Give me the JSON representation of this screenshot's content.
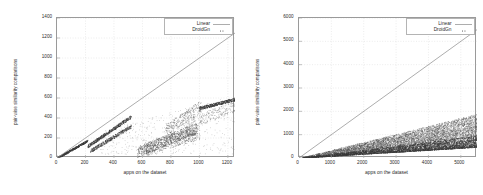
{
  "figure": {
    "panel_count": 2,
    "background": "#ffffff",
    "axis_color": "#9a9a9a",
    "grid_color": "#d8d8d8",
    "text_color": "#2b2b2b",
    "linear_color": "#8a8a8a",
    "point_color": "#3a3a3a"
  },
  "chart_data": [
    {
      "type": "scatter",
      "title": "",
      "xlabel": "apps on the dataset",
      "ylabel": "pair-wise similarity comparisons",
      "xlim": [
        0,
        1250
      ],
      "ylim": [
        0,
        1400
      ],
      "xticks": [
        0,
        200,
        400,
        600,
        800,
        1000,
        1200
      ],
      "yticks": [
        0,
        200,
        400,
        600,
        800,
        1000,
        1200,
        1400
      ],
      "grid": true,
      "legend_position": "top-right",
      "legend": [
        "Linear",
        "DroidGn"
      ],
      "series": [
        {
          "name": "Linear",
          "style": "line",
          "x": [
            0,
            1250
          ],
          "values": [
            0,
            1250
          ],
          "note": "y = x reference line"
        },
        {
          "name": "DroidGn",
          "style": "points",
          "note": "sub-linear scatter: multiple rising diagonal bands with wide dispersion; reaches ~600 comparisons at 1250 apps",
          "x": [
            20,
            60,
            110,
            150,
            180,
            210,
            240,
            280,
            320,
            360,
            400,
            440,
            480,
            520,
            560,
            600,
            650,
            700,
            750,
            800,
            850,
            900,
            950,
            1000,
            1050,
            1100,
            1150,
            1200,
            1250
          ],
          "values": [
            10,
            30,
            55,
            80,
            110,
            140,
            170,
            200,
            230,
            260,
            290,
            320,
            350,
            380,
            410,
            300,
            180,
            140,
            160,
            190,
            230,
            270,
            320,
            420,
            520,
            545,
            560,
            572,
            585
          ]
        }
      ]
    },
    {
      "type": "scatter",
      "title": "",
      "xlabel": "apps on the dataset",
      "ylabel": "pair-wise similarity comparisons",
      "xlim": [
        0,
        5500
      ],
      "ylim": [
        0,
        6000
      ],
      "xticks": [
        0,
        1000,
        2000,
        3000,
        4000,
        5000
      ],
      "yticks": [
        0,
        1000,
        2000,
        3000,
        4000,
        5000,
        6000
      ],
      "grid": true,
      "legend_position": "top-right",
      "legend": [
        "Linear",
        "DroidGn"
      ],
      "series": [
        {
          "name": "Linear",
          "style": "line",
          "x": [
            0,
            5500
          ],
          "values": [
            0,
            5500
          ],
          "note": "y = x reference line"
        },
        {
          "name": "DroidGn",
          "style": "points",
          "note": "dense wedge-shaped cloud hugging the x-axis, widening with x; upper envelope ~1400 at 5500 apps",
          "x": [
            250,
            500,
            750,
            1000,
            1250,
            1500,
            1750,
            2000,
            2250,
            2500,
            2750,
            3000,
            3250,
            3500,
            3750,
            4000,
            4250,
            4500,
            4750,
            5000,
            5250,
            5500
          ],
          "values": [
            30,
            60,
            95,
            130,
            165,
            200,
            240,
            280,
            325,
            370,
            415,
            460,
            510,
            560,
            610,
            660,
            710,
            760,
            810,
            860,
            910,
            960
          ]
        }
      ]
    }
  ]
}
